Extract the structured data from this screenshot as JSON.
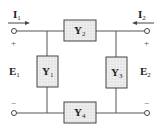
{
  "diagram": {
    "type": "two-port pi/bridge network",
    "colors": {
      "wire": "#555555",
      "box_fill": "#e8e8e8",
      "box_stroke": "#444444"
    },
    "currents": [
      {
        "name": "I",
        "sub": "1",
        "direction": "right"
      },
      {
        "name": "I",
        "sub": "2",
        "direction": "left"
      }
    ],
    "voltages": [
      {
        "name": "E",
        "sub": "1"
      },
      {
        "name": "E",
        "sub": "2"
      }
    ],
    "admittances": [
      {
        "name": "Y",
        "sub": "1"
      },
      {
        "name": "Y",
        "sub": "2"
      },
      {
        "name": "Y",
        "sub": "3"
      },
      {
        "name": "Y",
        "sub": "4"
      }
    ],
    "signs": {
      "plus": "+",
      "minus": "−"
    }
  }
}
